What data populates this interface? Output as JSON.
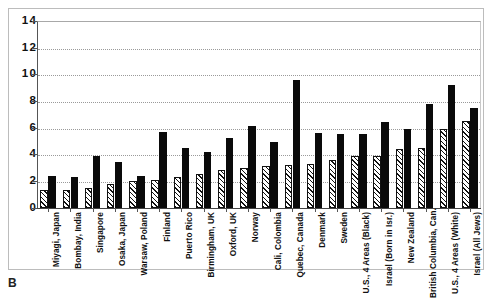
{
  "panel": {
    "label": "B"
  },
  "chart_data": {
    "type": "bar",
    "title": "",
    "xlabel": "",
    "ylabel": "",
    "ylim": [
      0,
      14
    ],
    "yticks": [
      0,
      2,
      4,
      6,
      8,
      10,
      12,
      14
    ],
    "grid": true,
    "legend_position": "none",
    "categories": [
      "Miyagi, Japan",
      "Bombay, India",
      "Singapore",
      "Osaka, Japan",
      "Warsaw, Poland",
      "Finland",
      "Puerto Rico",
      "Birmingham, UK",
      "Oxford, UK",
      "Norway",
      "Cali, Colombia",
      "Quebec, Canada",
      "Denmark",
      "Sweden",
      "U.S., 4 Areas (Black)",
      "Israel (Born in Isr.)",
      "New Zealand",
      "British Columbia, Can.",
      "U.S., 4 Areas (White)",
      "Israel (All Jews)"
    ],
    "series": [
      {
        "name": "hatched",
        "pattern": "diagonal-hatch",
        "color": "#ffffff",
        "values": [
          1.3,
          1.3,
          1.5,
          1.8,
          2.0,
          2.1,
          2.3,
          2.5,
          2.8,
          3.0,
          3.1,
          3.2,
          3.3,
          3.6,
          3.9,
          3.9,
          4.4,
          4.5,
          5.9,
          6.5
        ]
      },
      {
        "name": "solid",
        "pattern": "solid",
        "color": "#0a0a0a",
        "values": [
          2.4,
          2.3,
          3.9,
          3.4,
          2.4,
          5.7,
          4.5,
          4.2,
          5.2,
          6.1,
          4.9,
          9.6,
          5.6,
          5.5,
          5.5,
          6.4,
          5.9,
          7.8,
          9.2,
          7.5
        ]
      }
    ]
  }
}
